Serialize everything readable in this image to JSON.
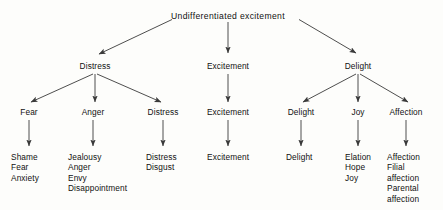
{
  "diagram": {
    "title": "Undifferentiated excitement",
    "background_color": "#fdfdfb",
    "line_color": "#3a3a3a",
    "text_color": "#111111",
    "levels": {
      "root": "Undifferentiated excitement",
      "level2": [
        "Distress",
        "Excitement",
        "Delight"
      ],
      "level3": [
        "Fear",
        "Anger",
        "Distress",
        "Excitement",
        "Delight",
        "Joy",
        "Affection"
      ],
      "level4": [
        [
          "Shame",
          "Fear",
          "Anxiety"
        ],
        [
          "Jealousy",
          "Anger",
          "Envy",
          "Disappointment"
        ],
        [
          "Distress",
          "Disgust"
        ],
        [
          "Excitement"
        ],
        [
          "Delight"
        ],
        [
          "Elation",
          "Hope",
          "Joy"
        ],
        [
          "Affection",
          "Filial",
          "affection",
          "Parental",
          "affection"
        ]
      ]
    },
    "nodes": {
      "root": "Undifferentiated excitement",
      "distress_l2": "Distress",
      "excitement_l2": "Excitement",
      "delight_l2": "Delight",
      "fear_l3": "Fear",
      "anger_l3": "Anger",
      "distress_l3": "Distress",
      "excitement_l3": "Excitement",
      "delight_l3": "Delight",
      "joy_l3": "Joy",
      "affection_l3": "Affection",
      "fear_leaf_1": "Shame",
      "fear_leaf_2": "Fear",
      "fear_leaf_3": "Anxiety",
      "anger_leaf_1": "Jealousy",
      "anger_leaf_2": "Anger",
      "anger_leaf_3": "Envy",
      "anger_leaf_4": "Disappointment",
      "distress_leaf_1": "Distress",
      "distress_leaf_2": "Disgust",
      "excitement_leaf_1": "Excitement",
      "delight_leaf_1": "Delight",
      "joy_leaf_1": "Elation",
      "joy_leaf_2": "Hope",
      "joy_leaf_3": "Joy",
      "affection_leaf_1": "Affection",
      "affection_leaf_2": "Filial",
      "affection_leaf_3": "affection",
      "affection_leaf_4": "Parental",
      "affection_leaf_5": "affection"
    }
  }
}
